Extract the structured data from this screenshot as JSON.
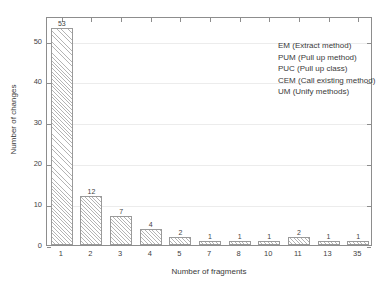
{
  "chart_data": {
    "type": "bar",
    "title": "",
    "categories": [
      "1",
      "2",
      "3",
      "4",
      "5",
      "7",
      "8",
      "10",
      "11",
      "13",
      "35"
    ],
    "values": [
      53,
      12,
      7,
      4,
      2,
      1,
      1,
      1,
      2,
      1,
      1
    ],
    "bar_labels": [
      "53",
      "12",
      "7",
      "4",
      "2",
      "1",
      "1",
      "1",
      "2",
      "1",
      "1"
    ],
    "xlabel": "Number of fragments",
    "ylabel": "Number of changes",
    "ylim": [
      0,
      56
    ],
    "xlim": [
      0,
      11
    ],
    "yticks": [
      0,
      10,
      20,
      30,
      40,
      50
    ],
    "ytick_labels": [
      "0",
      "10",
      "20",
      "30",
      "40",
      "50"
    ],
    "grid": "horizontal",
    "legend_position": "top-right",
    "legend": [
      "EM (Extract method)",
      "PUM (Pull up method)",
      "PUC (Pull up class)",
      "CEM (Call existing method)",
      "UM (Unify methods)"
    ],
    "bar_fill": "diagonal-hatch",
    "colors": {
      "background": "#ffffff",
      "axis": "#8d8d8d",
      "grid": "#ececec",
      "bar_edge": "#9a9a9a",
      "hatch": "#b4b4b4",
      "text": "#3a3a3a"
    }
  }
}
